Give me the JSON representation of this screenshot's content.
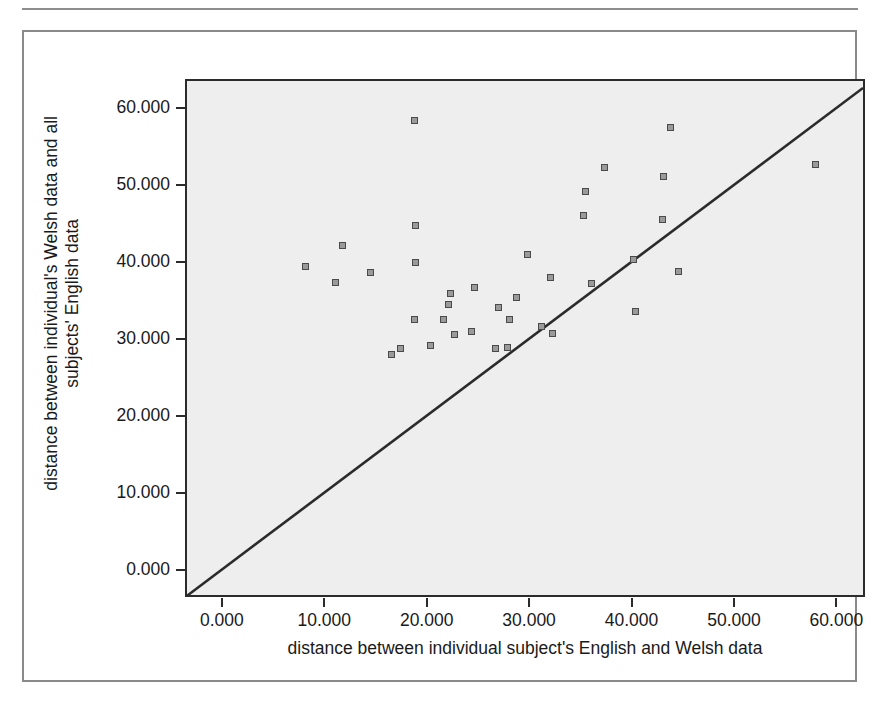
{
  "figure": {
    "background": "#ffffff",
    "frame_color": "#8a8a8a",
    "panel_background": "#eeeeee",
    "panel_border_color": "#2b2b2b",
    "marker_fill": "#9a9a9a",
    "marker_edge": "#4a4a4a",
    "reference_line_color": "#2b2b2b"
  },
  "axes": {
    "x_title": "distance between individual subject's English and Welsh data",
    "y_title_line1": "distance between individual's Welsh data and all",
    "y_title_line2": "subjects' English data",
    "x_ticks": [
      "0.000",
      "10.000",
      "20.000",
      "30.000",
      "40.000",
      "50.000",
      "60.000"
    ],
    "y_ticks": [
      "60.000",
      "50.000",
      "40.000",
      "30.000",
      "20.000",
      "10.000",
      "0.000"
    ]
  },
  "chart_data": {
    "type": "scatter",
    "title": "",
    "xlabel": "distance between individual subject's English and Welsh data",
    "ylabel": "distance between individual's Welsh data and all subjects' English data",
    "xlim": [
      -3.4,
      62.6
    ],
    "ylim": [
      -3.3,
      63.5
    ],
    "xticks": [
      0,
      10,
      20,
      30,
      40,
      50,
      60
    ],
    "yticks": [
      0,
      10,
      20,
      30,
      40,
      50,
      60
    ],
    "xtick_labels": [
      "0.000",
      "10.000",
      "20.000",
      "30.000",
      "40.000",
      "50.000",
      "60.000"
    ],
    "ytick_labels": [
      "0.000",
      "10.000",
      "20.000",
      "30.000",
      "40.000",
      "50.000",
      "60.000"
    ],
    "grid": false,
    "legend": null,
    "marker": "square",
    "annotations": [
      {
        "type": "reference_line",
        "description": "identity line y = x drawn corner to corner",
        "x": [
          -3.4,
          62.6
        ],
        "y": [
          -3.4,
          62.6
        ]
      }
    ],
    "points": [
      {
        "x": 8.2,
        "y": 39.4
      },
      {
        "x": 11.1,
        "y": 37.3
      },
      {
        "x": 11.8,
        "y": 42.1
      },
      {
        "x": 14.5,
        "y": 38.6
      },
      {
        "x": 16.6,
        "y": 27.9
      },
      {
        "x": 17.4,
        "y": 28.7
      },
      {
        "x": 18.8,
        "y": 58.4
      },
      {
        "x": 18.9,
        "y": 44.7
      },
      {
        "x": 18.9,
        "y": 39.9
      },
      {
        "x": 18.8,
        "y": 32.5
      },
      {
        "x": 20.4,
        "y": 29.1
      },
      {
        "x": 21.6,
        "y": 32.5
      },
      {
        "x": 22.1,
        "y": 34.4
      },
      {
        "x": 22.3,
        "y": 35.9
      },
      {
        "x": 22.7,
        "y": 30.5
      },
      {
        "x": 24.4,
        "y": 30.9
      },
      {
        "x": 24.7,
        "y": 36.6
      },
      {
        "x": 26.7,
        "y": 28.8
      },
      {
        "x": 27.0,
        "y": 34.0
      },
      {
        "x": 27.9,
        "y": 28.9
      },
      {
        "x": 28.1,
        "y": 32.5
      },
      {
        "x": 28.8,
        "y": 35.3
      },
      {
        "x": 29.8,
        "y": 40.9
      },
      {
        "x": 31.2,
        "y": 31.6
      },
      {
        "x": 32.1,
        "y": 37.9
      },
      {
        "x": 32.3,
        "y": 30.7
      },
      {
        "x": 35.3,
        "y": 46.0
      },
      {
        "x": 35.5,
        "y": 49.1
      },
      {
        "x": 36.1,
        "y": 37.2
      },
      {
        "x": 37.4,
        "y": 52.3
      },
      {
        "x": 40.2,
        "y": 40.3
      },
      {
        "x": 40.4,
        "y": 33.5
      },
      {
        "x": 43.0,
        "y": 45.5
      },
      {
        "x": 43.1,
        "y": 51.1
      },
      {
        "x": 43.8,
        "y": 57.5
      },
      {
        "x": 44.6,
        "y": 38.8
      },
      {
        "x": 58.0,
        "y": 52.6
      }
    ]
  }
}
